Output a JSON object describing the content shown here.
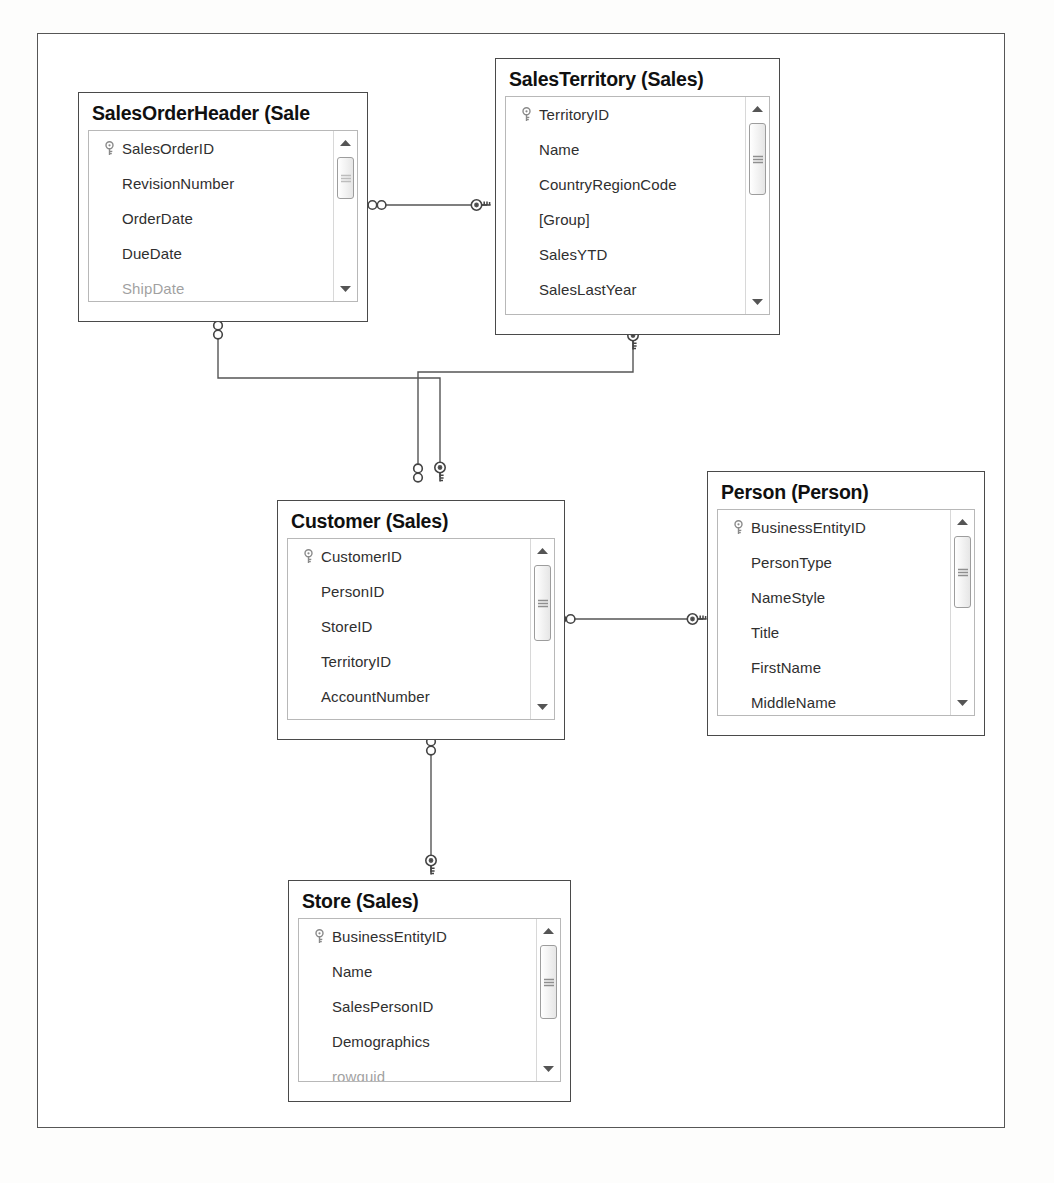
{
  "diagram": {
    "frame_color": "#565656",
    "table_border_color": "#4a4a4a",
    "grid_border_color": "#b8b8b8",
    "text_color": "#2f2f2f",
    "title_color": "#101010",
    "connector_color": "#555555"
  },
  "tables": [
    {
      "id": "salesorderheader",
      "title": "SalesOrderHeader (Sale",
      "title_full": "SalesOrderHeader (Sales)",
      "fields": [
        {
          "name": "SalesOrderID",
          "key": true,
          "clipped": false
        },
        {
          "name": "RevisionNumber",
          "key": false,
          "clipped": false
        },
        {
          "name": "OrderDate",
          "key": false,
          "clipped": false
        },
        {
          "name": "DueDate",
          "key": false,
          "clipped": false
        },
        {
          "name": "ShipDate",
          "key": false,
          "clipped": true
        }
      ],
      "scrollbar": {
        "up_icon": "triangle-up-icon",
        "down_icon": "triangle-down-icon",
        "thumb_position": "top"
      }
    },
    {
      "id": "salesterritory",
      "title": "SalesTerritory (Sales)",
      "title_full": "SalesTerritory (Sales)",
      "fields": [
        {
          "name": "TerritoryID",
          "key": true,
          "clipped": false
        },
        {
          "name": "Name",
          "key": false,
          "clipped": false
        },
        {
          "name": "CountryRegionCode",
          "key": false,
          "clipped": false
        },
        {
          "name": "[Group]",
          "key": false,
          "clipped": false
        },
        {
          "name": "SalesYTD",
          "key": false,
          "clipped": false
        },
        {
          "name": "SalesLastYear",
          "key": false,
          "clipped": false
        }
      ],
      "scrollbar": {
        "up_icon": "triangle-up-icon",
        "down_icon": "triangle-down-icon",
        "thumb_position": "top"
      }
    },
    {
      "id": "customer",
      "title": "Customer (Sales)",
      "title_full": "Customer (Sales)",
      "fields": [
        {
          "name": "CustomerID",
          "key": true,
          "clipped": false
        },
        {
          "name": "PersonID",
          "key": false,
          "clipped": false
        },
        {
          "name": "StoreID",
          "key": false,
          "clipped": false
        },
        {
          "name": "TerritoryID",
          "key": false,
          "clipped": false
        },
        {
          "name": "AccountNumber",
          "key": false,
          "clipped": false
        }
      ],
      "scrollbar": {
        "up_icon": "triangle-up-icon",
        "down_icon": "triangle-down-icon",
        "thumb_position": "top"
      }
    },
    {
      "id": "person",
      "title": "Person (Person)",
      "title_full": "Person (Person)",
      "fields": [
        {
          "name": "BusinessEntityID",
          "key": true,
          "clipped": false
        },
        {
          "name": "PersonType",
          "key": false,
          "clipped": false
        },
        {
          "name": "NameStyle",
          "key": false,
          "clipped": false
        },
        {
          "name": "Title",
          "key": false,
          "clipped": false
        },
        {
          "name": "FirstName",
          "key": false,
          "clipped": false
        },
        {
          "name": "MiddleName",
          "key": false,
          "clipped": false
        }
      ],
      "scrollbar": {
        "up_icon": "triangle-up-icon",
        "down_icon": "triangle-down-icon",
        "thumb_position": "top"
      }
    },
    {
      "id": "store",
      "title": "Store (Sales)",
      "title_full": "Store (Sales)",
      "fields": [
        {
          "name": "BusinessEntityID",
          "key": true,
          "clipped": false
        },
        {
          "name": "Name",
          "key": false,
          "clipped": false
        },
        {
          "name": "SalesPersonID",
          "key": false,
          "clipped": false
        },
        {
          "name": "Demographics",
          "key": false,
          "clipped": false
        },
        {
          "name": "rowguid",
          "key": false,
          "clipped": true
        }
      ],
      "scrollbar": {
        "up_icon": "triangle-up-icon",
        "down_icon": "triangle-down-icon",
        "thumb_position": "top"
      }
    }
  ],
  "relationships": [
    {
      "id": "rel-soh-territory",
      "from_table": "salesorderheader",
      "to_table": "salesterritory",
      "from_cardinality": "many",
      "to_cardinality": "one",
      "from_icon": "infinity-icon",
      "to_icon": "key-icon"
    },
    {
      "id": "rel-soh-customer",
      "from_table": "salesorderheader",
      "to_table": "customer",
      "from_cardinality": "many",
      "to_cardinality": "one",
      "from_icon": "infinity-icon",
      "to_icon": "key-icon"
    },
    {
      "id": "rel-territory-customer",
      "from_table": "salesterritory",
      "to_table": "customer",
      "from_cardinality": "one",
      "to_cardinality": "many",
      "from_icon": "key-icon",
      "to_icon": "infinity-icon"
    },
    {
      "id": "rel-customer-person",
      "from_table": "customer",
      "to_table": "person",
      "from_cardinality": "many",
      "to_cardinality": "one",
      "from_icon": "infinity-icon",
      "to_icon": "key-icon"
    },
    {
      "id": "rel-customer-store",
      "from_table": "customer",
      "to_table": "store",
      "from_cardinality": "many",
      "to_cardinality": "one",
      "from_icon": "infinity-icon",
      "to_icon": "key-icon"
    }
  ]
}
